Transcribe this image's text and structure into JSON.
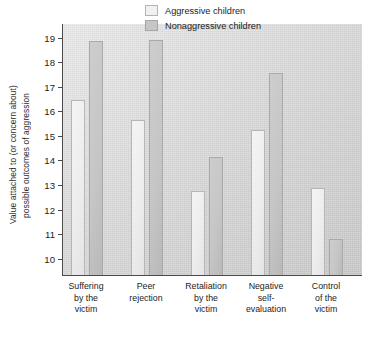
{
  "chart_data": {
    "type": "bar",
    "title": "",
    "xlabel": "",
    "ylabel": "Value attached to (or concern about) possible outcomes of aggression",
    "ylabel_lines": [
      "Value attached to (or concern about)",
      "possible outcomes of aggression"
    ],
    "ylim": [
      9.3,
      19.55
    ],
    "yticks": [
      10,
      11,
      12,
      13,
      14,
      15,
      16,
      17,
      18,
      19
    ],
    "ytick_labels": [
      "10",
      "11",
      "12",
      "13",
      "14",
      "15",
      "16",
      "17",
      "18",
      "19"
    ],
    "grid": false,
    "legend_position": "top-right",
    "categories": [
      "Suffering by the victim",
      "Peer rejection",
      "Retaliation by the victim",
      "Negative self-evaluation",
      "Control of the victim"
    ],
    "category_lines": [
      [
        "Suffering",
        "by the",
        "victim"
      ],
      [
        "Peer",
        "rejection"
      ],
      [
        "Retaliation",
        "by the",
        "victim"
      ],
      [
        "Negative",
        "self-",
        "evaluation"
      ],
      [
        "Control",
        "of the",
        "victim"
      ]
    ],
    "series": [
      {
        "name": "Aggressive children",
        "color": "#f1f1f1",
        "values": [
          16.4,
          15.6,
          12.7,
          15.2,
          12.85
        ]
      },
      {
        "name": "Nonaggressive children",
        "color": "#c6c6c6",
        "values": [
          18.8,
          18.85,
          14.1,
          17.5,
          10.75
        ]
      }
    ]
  },
  "legend": {
    "items": [
      {
        "label": "Aggressive children"
      },
      {
        "label": "Nonaggressive children"
      }
    ]
  }
}
